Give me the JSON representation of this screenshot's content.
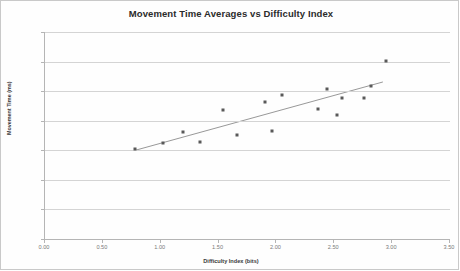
{
  "chart_data": {
    "type": "scatter",
    "title": "Movement Time Averages vs Difficulty Index",
    "xlabel": "Difficulty Index (bits)",
    "ylabel": "Movement Time (ms)",
    "xlim": [
      0.0,
      3.5
    ],
    "ylim": [
      0.0,
      1400.0
    ],
    "xticks": [
      0.0,
      0.5,
      1.0,
      1.5,
      2.0,
      2.5,
      3.0,
      3.5
    ],
    "xtick_labels": [
      "0.00",
      "0.50",
      "1.00",
      "1.50",
      "2.00",
      "2.50",
      "3.00",
      "3.50"
    ],
    "yticks": [
      0.0,
      200.0,
      400.0,
      600.0,
      800.0,
      1000.0,
      1200.0,
      1400.0
    ],
    "ytick_labels": [
      "0.0",
      "200.0",
      "400.0",
      "600.0",
      "800.0",
      "1000.0",
      "1200.0",
      "1400.0"
    ],
    "grid": "horizontal",
    "legend": "none",
    "marker_color": "#595959",
    "trendline_color": "#8c8c8c",
    "gridline_color": "#d4d4d4",
    "points": [
      {
        "x": 0.78,
        "y": 608
      },
      {
        "x": 1.02,
        "y": 648
      },
      {
        "x": 1.19,
        "y": 723
      },
      {
        "x": 1.34,
        "y": 655
      },
      {
        "x": 1.54,
        "y": 875
      },
      {
        "x": 1.66,
        "y": 705
      },
      {
        "x": 1.9,
        "y": 925
      },
      {
        "x": 1.96,
        "y": 732
      },
      {
        "x": 2.05,
        "y": 973
      },
      {
        "x": 2.36,
        "y": 878
      },
      {
        "x": 2.44,
        "y": 1012
      },
      {
        "x": 2.52,
        "y": 840
      },
      {
        "x": 2.57,
        "y": 955
      },
      {
        "x": 2.76,
        "y": 953
      },
      {
        "x": 2.82,
        "y": 1032
      },
      {
        "x": 2.95,
        "y": 1205
      }
    ],
    "trendline": {
      "x0": 0.78,
      "y0": 600,
      "x1": 2.92,
      "y1": 1062
    }
  }
}
